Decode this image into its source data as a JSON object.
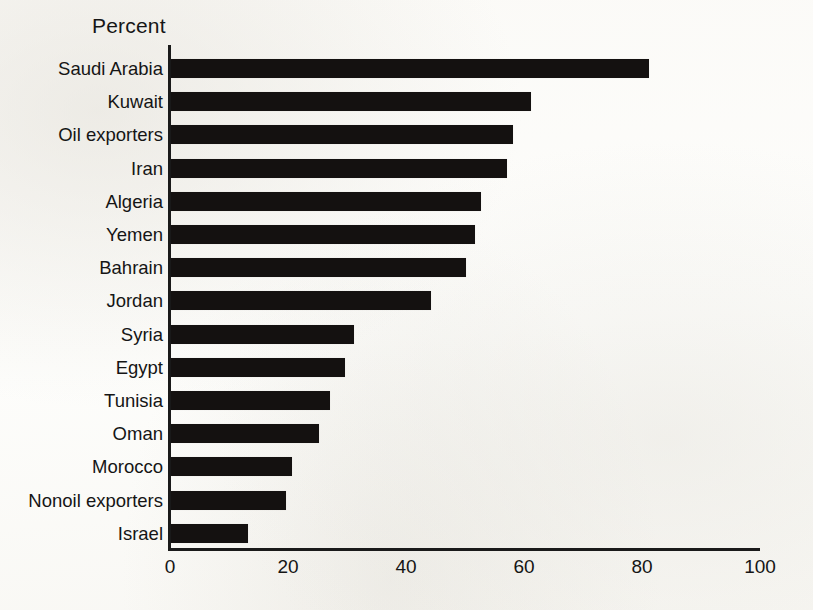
{
  "chart_data": {
    "type": "bar",
    "orientation": "horizontal",
    "title": "Percent",
    "xlabel": "",
    "ylabel": "",
    "xlim": [
      0,
      100
    ],
    "xticks": [
      0,
      20,
      40,
      60,
      80,
      100
    ],
    "xtick_labels": [
      "0",
      "20",
      "40",
      "60",
      "80",
      "100"
    ],
    "grid": false,
    "legend": null,
    "bar_color": "#141110",
    "background_color": "#fdfdfb",
    "axis_color": "#1a1a1a",
    "categories": [
      "Saudi Arabia",
      "Kuwait",
      "Oil exporters",
      "Iran",
      "Algeria",
      "Yemen",
      "Bahrain",
      "Jordan",
      "Syria",
      "Egypt",
      "Tunisia",
      "Oman",
      "Morocco",
      "Nonoil exporters",
      "Israel"
    ],
    "values": [
      81,
      61,
      58,
      57,
      52.5,
      51.5,
      50,
      44,
      31,
      29.5,
      27,
      25,
      20.5,
      19.5,
      13
    ]
  }
}
